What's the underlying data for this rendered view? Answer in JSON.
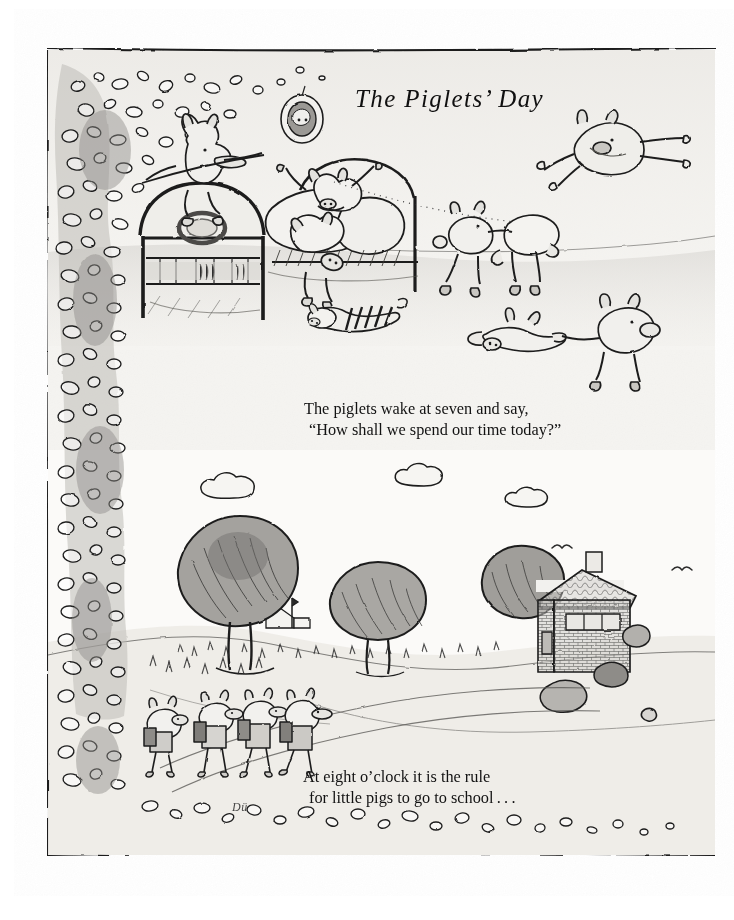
{
  "page": {
    "background_color": "#ffffff",
    "paper_tint": "#f3f2ef",
    "ink_color": "#1a1a1a",
    "wash_color": "#9a9a98"
  },
  "frame": {
    "name": "hand-drawn-ink-border",
    "top_rule_y": 48,
    "bottom_rule_y": 856,
    "left_rule_x": 47,
    "right_edge_x": 716
  },
  "title": "The Piglets’ Day",
  "captions": [
    {
      "id": "caption-one",
      "lines": [
        "The piglets wake at seven and say,",
        "“How shall we spend our time today?”"
      ]
    },
    {
      "id": "caption-two",
      "lines": [
        "At eight o’clock it is the rule",
        "for little pigs to go to school . . ."
      ]
    }
  ],
  "signature": "Dü",
  "scenes": {
    "top": {
      "name": "bedroom-scene",
      "description": "Piglets waking up: one leaping off the iron bed headboard, two bouncing on the bed, one in striped pyjamas sprawled on the floor, others flying and chasing across the room.",
      "elements": [
        {
          "name": "oval-portrait",
          "label": "framed pig portrait on wall"
        },
        {
          "name": "iron-bed",
          "label": "bed with round medallion headboard"
        },
        {
          "name": "pillow-pile",
          "label": "pillows and bedding"
        },
        {
          "name": "striped-pyjama-piglet",
          "label": "piglet lying on floor in striped pyjamas"
        },
        {
          "name": "flying-piglet",
          "label": "piglet leaping through the air"
        },
        {
          "name": "pillow-carrying-piglets",
          "label": "two piglets carrying a pillow"
        },
        {
          "name": "chasing-piglets",
          "label": "piglet pulling another by the leg"
        }
      ]
    },
    "bottom": {
      "name": "walk-to-school-scene",
      "description": "Four piglets with satchels walking along a country lane past trees toward a stone schoolhouse; clouds, birds and a distant church spire on the horizon.",
      "elements": [
        {
          "name": "big-tree-left",
          "label": "large round tree on the hill"
        },
        {
          "name": "tree-middle",
          "label": "second tree beside the lane"
        },
        {
          "name": "schoolhouse",
          "label": "stone schoolhouse with shingled roof and chimney"
        },
        {
          "name": "distant-church",
          "label": "far-off church with spire"
        },
        {
          "name": "cloud-left",
          "label": "small cloud"
        },
        {
          "name": "cloud-middle",
          "label": "small cloud"
        },
        {
          "name": "cloud-right",
          "label": "small cloud"
        },
        {
          "name": "birds",
          "label": "two birds in flight"
        },
        {
          "name": "schoolchildren-piglets",
          "label": "four piglets with satchels walking to school"
        },
        {
          "name": "country-lane",
          "label": "winding path"
        }
      ]
    },
    "border": {
      "name": "foliage-border",
      "description": "Dense column of hand-drawn leaves and pebbles running down the left edge and along the bottom of the plate."
    }
  }
}
